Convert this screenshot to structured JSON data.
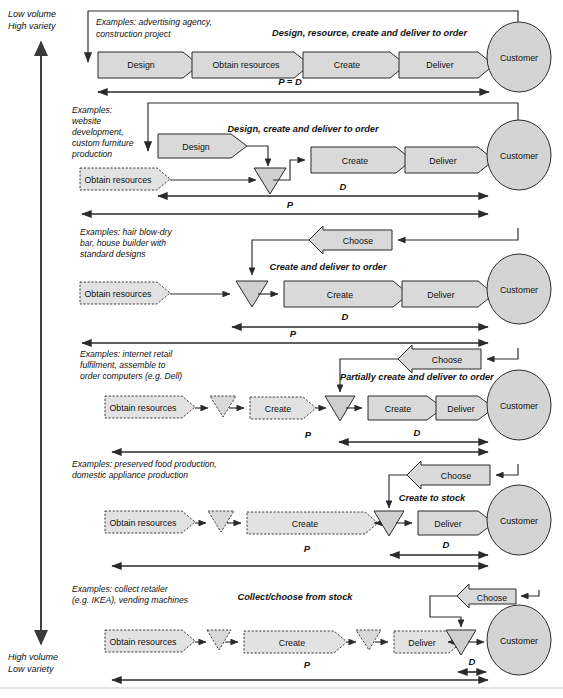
{
  "axis": {
    "top_line1": "Low volume",
    "top_line2": "High variety",
    "bottom_line1": "High volume",
    "bottom_line2": "Low variety"
  },
  "labels": {
    "obtain_resources": "Obtain resources",
    "design": "Design",
    "create": "Create",
    "deliver": "Deliver",
    "choose": "Choose",
    "customer": "Customer",
    "P": "P",
    "D": "D",
    "PeqD": "P = D"
  },
  "rows": [
    {
      "id": "design-resource-create-deliver-to-order",
      "examples": [
        "Examples: advertising agency,",
        "construction project"
      ],
      "caption": "Design, resource, create and deliver to order",
      "stages": [
        "Design",
        "Obtain resources",
        "Create",
        "Deliver"
      ],
      "customer": "Customer",
      "measures": [
        "P = D"
      ]
    },
    {
      "id": "design-create-deliver-to-order",
      "examples": [
        "Examples:",
        "website",
        "development,",
        "custom furniture",
        "production"
      ],
      "caption": "Design, create and deliver to order",
      "stages": [
        "Design",
        "Obtain resources",
        "Create",
        "Deliver"
      ],
      "customer": "Customer",
      "measures": [
        "D",
        "P"
      ]
    },
    {
      "id": "create-and-deliver-to-order",
      "examples": [
        "Examples: hair blow-dry",
        "bar, house builder with",
        "standard designs"
      ],
      "caption": "Create and deliver to order",
      "stages": [
        "Obtain resources",
        "Create",
        "Deliver"
      ],
      "choose": "Choose",
      "customer": "Customer",
      "measures": [
        "D",
        "P"
      ]
    },
    {
      "id": "partially-create-and-deliver-to-order",
      "examples": [
        "Examples: internet retail",
        "fulfilment, assemble to",
        "order computers (e.g. Dell)"
      ],
      "caption": "Partially create and deliver to order",
      "stages": [
        "Obtain resources",
        "Create",
        "Create",
        "Deliver"
      ],
      "choose": "Choose",
      "customer": "Customer",
      "measures": [
        "P",
        "D"
      ]
    },
    {
      "id": "create-to-stock",
      "examples": [
        "Examples: preserved food production,",
        "domestic appliance production"
      ],
      "caption": "Create to stock",
      "stages": [
        "Obtain resources",
        "Create",
        "Deliver"
      ],
      "choose": "Choose",
      "customer": "Customer",
      "measures": [
        "D",
        "P"
      ]
    },
    {
      "id": "collect-choose-from-stock",
      "examples": [
        "Examples: collect retailer",
        "(e.g. IKEA), vending machines"
      ],
      "caption": "Collect/choose from stock",
      "stages": [
        "Obtain resources",
        "Create",
        "Deliver"
      ],
      "choose": "Choose",
      "customer": "Customer",
      "measures": [
        "P",
        "D"
      ]
    }
  ],
  "colors": {
    "process_fill": "#d9d9d9",
    "process_fill_dashed": "#e2e2e2",
    "triangle_fill": "#cfcfcf",
    "customer_fill": "#d4d4d4",
    "line": "#2b2b2b"
  }
}
